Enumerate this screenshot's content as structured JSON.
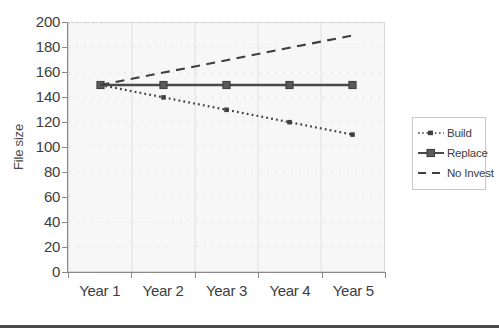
{
  "chart_data": {
    "type": "line",
    "title": "",
    "xlabel": "",
    "ylabel": "File size",
    "categories": [
      "Year 1",
      "Year 2",
      "Year 3",
      "Year 4",
      "Year 5"
    ],
    "ylim": [
      0,
      200
    ],
    "ytick_labels": [
      "200",
      "180",
      "160",
      "140",
      "120",
      "100",
      "80",
      "60",
      "40",
      "20",
      "0"
    ],
    "ytick_values": [
      200,
      180,
      160,
      140,
      120,
      100,
      80,
      60,
      40,
      20,
      0
    ],
    "grid": true,
    "grid_style": "dotted",
    "legend_position": "right",
    "series": [
      {
        "name": "Build",
        "values": [
          150,
          140,
          130,
          120,
          110
        ],
        "line_style": "dotted",
        "marker": "small-square",
        "color": "#3f3f3f"
      },
      {
        "name": "Replace",
        "values": [
          150,
          150,
          150,
          150,
          150
        ],
        "line_style": "solid",
        "marker": "square",
        "color": "#4a4a4a"
      },
      {
        "name": "No Invest",
        "values": [
          150,
          160,
          170,
          180,
          190
        ],
        "line_style": "dashed",
        "marker": "none",
        "color": "#3f3f3f"
      }
    ]
  },
  "legend": {
    "entries": [
      {
        "label": "Build"
      },
      {
        "label": "Replace"
      },
      {
        "label": "No Invest"
      }
    ]
  },
  "axes": {
    "y_title": "File size"
  }
}
